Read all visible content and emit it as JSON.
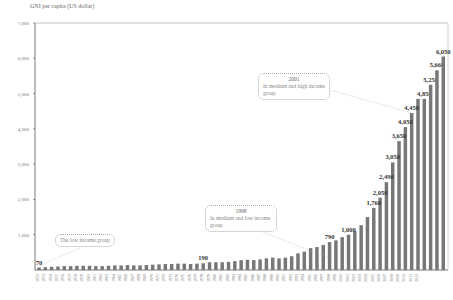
{
  "chart_data": {
    "type": "bar",
    "title": "",
    "ylabel": "GNI per capita (US dollar)",
    "xlabel": "",
    "ylim": [
      0,
      7000
    ],
    "yticks": [
      1000,
      2000,
      3000,
      4000,
      5000,
      6000,
      7000
    ],
    "ytick_labels": [
      "1,000",
      "2,000",
      "3,000",
      "4,000",
      "5,000",
      "6,000",
      "7,000"
    ],
    "grid": false,
    "legend": null,
    "categories": [
      "1952",
      "1953",
      "1954",
      "1955",
      "1956",
      "1957",
      "1958",
      "1959",
      "1960",
      "1961",
      "1962",
      "1963",
      "1964",
      "1965",
      "1966",
      "1967",
      "1968",
      "1969",
      "1970",
      "1971",
      "1972",
      "1973",
      "1974",
      "1975",
      "1976",
      "1977",
      "1978",
      "1979",
      "1980",
      "1981",
      "1982",
      "1983",
      "1984",
      "1985",
      "1986",
      "1987",
      "1988",
      "1989",
      "1990",
      "1991",
      "1992",
      "1993",
      "1994",
      "1995",
      "1996",
      "1997",
      "1998",
      "1999",
      "2000",
      "2001",
      "2002",
      "2003",
      "2004",
      "2005",
      "2006",
      "2007",
      "2008",
      "2009",
      "2010",
      "2011",
      "2012"
    ],
    "values": [
      70,
      80,
      90,
      100,
      110,
      110,
      120,
      120,
      120,
      110,
      110,
      120,
      130,
      130,
      140,
      130,
      130,
      140,
      150,
      160,
      170,
      170,
      180,
      180,
      170,
      180,
      190,
      220,
      220,
      220,
      230,
      250,
      280,
      290,
      280,
      300,
      330,
      350,
      330,
      350,
      390,
      470,
      520,
      620,
      650,
      710,
      790,
      840,
      930,
      1000,
      1100,
      1270,
      1500,
      1760,
      2050,
      2490,
      3050,
      3650,
      4050,
      4450,
      4850
    ],
    "data_labels": [
      {
        "category": "1952",
        "label": "70"
      },
      {
        "category": "1978",
        "label": "190"
      },
      {
        "category": "1998",
        "label": "790"
      },
      {
        "category": "2001",
        "label": "1,000"
      },
      {
        "category": "2005",
        "label": "1,760"
      },
      {
        "category": "2006",
        "label": "2,050"
      },
      {
        "category": "2007",
        "label": "2,490"
      },
      {
        "category": "2008",
        "label": "3,050"
      },
      {
        "category": "2009",
        "label": "3,650"
      },
      {
        "category": "2010",
        "label": "4,050"
      },
      {
        "category": "2011",
        "label": "4,450"
      }
    ],
    "extra_labels_right": [
      "4,850",
      "5,250",
      "5,660",
      "6,050"
    ],
    "annotations": [
      {
        "text": "The low income group",
        "target": "1952"
      },
      {
        "text": "1998\nIn medium and low income group",
        "target": "1998"
      },
      {
        "text": "2001\nIn medium and high income group",
        "target": "2011"
      }
    ],
    "bar_color": "#777777"
  },
  "notes": {
    "low": "The low income group",
    "mid_year": "1998",
    "mid_text": "In medium and low income group",
    "high_year": "2001",
    "high_text": "In medium and high income group"
  }
}
